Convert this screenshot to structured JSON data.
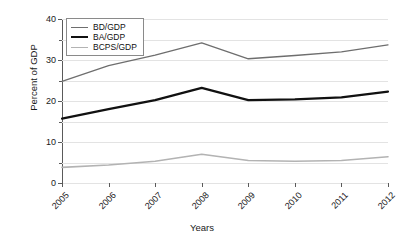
{
  "chart_data": {
    "type": "line",
    "title": "",
    "xlabel": "Years",
    "ylabel": "Percent of GDP",
    "categories": [
      "2005",
      "2006",
      "2007",
      "2008",
      "2009",
      "2010",
      "2011",
      "2012"
    ],
    "x": [
      2005,
      2006,
      2007,
      2008,
      2009,
      2010,
      2011,
      2012
    ],
    "ylim": [
      0,
      40
    ],
    "yticks": [
      0,
      10,
      20,
      30,
      40
    ],
    "yticks_minor": [
      5,
      15,
      25,
      35
    ],
    "ytick_labels": [
      "0",
      "10",
      "20",
      "30",
      "40"
    ],
    "grid": true,
    "grid_axis": "y",
    "legend_position": "top-left",
    "series": [
      {
        "name": "BD/GDP",
        "color": "#6e6e6e",
        "width": 1.3,
        "values": [
          24.8,
          28.6,
          31.2,
          34.2,
          30.3,
          31.1,
          32.0,
          33.7
        ]
      },
      {
        "name": "BA/GDP",
        "color": "#111111",
        "width": 2.2,
        "values": [
          15.7,
          18.0,
          20.2,
          23.2,
          20.2,
          20.4,
          20.9,
          22.3
        ]
      },
      {
        "name": "BCPS/GDP",
        "color": "#b3b3b3",
        "width": 1.6,
        "values": [
          3.8,
          4.4,
          5.3,
          7.0,
          5.5,
          5.3,
          5.5,
          6.4
        ]
      }
    ]
  }
}
